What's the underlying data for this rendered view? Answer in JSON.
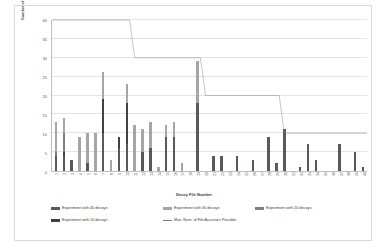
{
  "chart_data": {
    "type": "bar",
    "title": "",
    "xlabel": "Decoy File Number",
    "ylabel": "Number of Decoy File Accesses",
    "ylim": [
      0,
      40
    ],
    "yticks": [
      0,
      5,
      10,
      15,
      20,
      25,
      30,
      35,
      40
    ],
    "grid": true,
    "stacked": true,
    "legend_position": "bottom",
    "categories": [
      1,
      2,
      3,
      4,
      5,
      6,
      7,
      8,
      9,
      10,
      11,
      12,
      13,
      14,
      15,
      16,
      17,
      18,
      19,
      20,
      21,
      22,
      23,
      24,
      25,
      26,
      27,
      28,
      29,
      30,
      31,
      32,
      33,
      34,
      35,
      36,
      37,
      38,
      39,
      40
    ],
    "series": [
      {
        "name": "Experiment with 40 decoys",
        "color": "#595959",
        "values": [
          4,
          4,
          3,
          0,
          2,
          0,
          10,
          0,
          6,
          7,
          0,
          5,
          6,
          0,
          9,
          9,
          0,
          0,
          18,
          0,
          4,
          4,
          0,
          4,
          0,
          3,
          0,
          9,
          2,
          11,
          0,
          1,
          7,
          3,
          0,
          0,
          7,
          0,
          5,
          1
        ]
      },
      {
        "name": "Experiment with 30 decoys",
        "color": "#a6a6a6",
        "values": [
          8,
          4,
          0,
          9,
          8,
          10,
          7,
          3,
          0,
          5,
          12,
          6,
          7,
          1,
          3,
          4,
          2,
          0,
          11,
          0,
          0,
          0,
          0,
          0,
          0,
          0,
          0,
          0,
          0,
          0,
          0,
          0,
          0,
          0,
          0,
          0,
          0,
          0,
          0,
          0
        ]
      },
      {
        "name": "Experiment with 20 decoys",
        "color": "#7f7f7f",
        "values": [
          1,
          5,
          0,
          0,
          0,
          0,
          0,
          0,
          0,
          0,
          0,
          0,
          0,
          0,
          0,
          0,
          0,
          0,
          0,
          0,
          0,
          0,
          0,
          0,
          0,
          0,
          0,
          0,
          0,
          0,
          0,
          0,
          0,
          0,
          0,
          0,
          0,
          0,
          0,
          0
        ]
      },
      {
        "name": "Experiment with 10 decoys",
        "color": "#404040",
        "values": [
          0,
          1,
          0,
          0,
          0,
          0,
          9,
          0,
          3,
          11,
          0,
          0,
          0,
          0,
          0,
          0,
          0,
          0,
          0,
          0,
          0,
          0,
          0,
          0,
          0,
          0,
          0,
          0,
          0,
          0,
          0,
          0,
          0,
          0,
          0,
          0,
          0,
          0,
          0,
          0
        ]
      }
    ],
    "line_series": {
      "name": "Max. Num. of File Accesses Possible",
      "color": "#808080",
      "values": [
        40,
        40,
        40,
        40,
        40,
        40,
        40,
        40,
        40,
        40,
        30,
        30,
        30,
        30,
        30,
        30,
        30,
        30,
        30,
        20,
        20,
        20,
        20,
        20,
        20,
        20,
        20,
        20,
        20,
        10,
        10,
        10,
        10,
        10,
        10,
        10,
        10,
        10,
        10,
        10
      ]
    }
  },
  "legend": {
    "items": [
      {
        "label": "Experiment with 40 decoys",
        "icon": "legend-swatch",
        "color": "#595959"
      },
      {
        "label": "Experiment with 30 decoys",
        "icon": "legend-swatch",
        "color": "#a6a6a6"
      },
      {
        "label": "Experiment with 20 decoys",
        "icon": "legend-swatch",
        "color": "#7f7f7f"
      },
      {
        "label": "Experiment with 10 decoys",
        "icon": "legend-swatch",
        "color": "#404040"
      },
      {
        "label": "Max. Num. of File Accesses Possible",
        "icon": "legend-line",
        "color": "#808080"
      }
    ]
  }
}
